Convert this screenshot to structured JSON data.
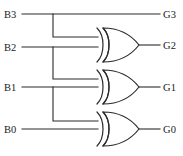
{
  "diagram": {
    "type": "logic-circuit",
    "width": 183,
    "height": 156,
    "background_color": "#ffffff",
    "line_color": "#2b2b2b",
    "text_color": "#1a1a1a"
  },
  "inputs": [
    {
      "id": "B3",
      "label": "B3",
      "label_x": 4,
      "label_y": 18,
      "wire_y": 14
    },
    {
      "id": "B2",
      "label": "B2",
      "label_x": 4,
      "label_y": 51,
      "wire_y": 47
    },
    {
      "id": "B1",
      "label": "B1",
      "label_x": 4,
      "label_y": 91,
      "wire_y": 87
    },
    {
      "id": "B0",
      "label": "B0",
      "label_x": 4,
      "label_y": 133,
      "wire_y": 129
    }
  ],
  "outputs": [
    {
      "id": "G3",
      "label": "G3",
      "label_x": 163,
      "label_y": 18,
      "wire_y": 14
    },
    {
      "id": "G2",
      "label": "G2",
      "label_x": 163,
      "label_y": 51,
      "wire_y": 45
    },
    {
      "id": "G1",
      "label": "G1",
      "label_x": 163,
      "label_y": 91,
      "wire_y": 87
    },
    {
      "id": "G0",
      "label": "G0",
      "label_x": 163,
      "label_y": 133,
      "wire_y": 129
    }
  ],
  "gates": [
    {
      "id": "xor-g2",
      "type": "XOR",
      "output": "G2",
      "inputs": [
        "B3",
        "B2"
      ],
      "x": 98,
      "y": 28,
      "width": 40,
      "height": 34
    },
    {
      "id": "xor-g1",
      "type": "XOR",
      "output": "G1",
      "inputs": [
        "B2",
        "B1"
      ],
      "x": 98,
      "y": 70,
      "width": 40,
      "height": 34
    },
    {
      "id": "xor-g0",
      "type": "XOR",
      "output": "G0",
      "inputs": [
        "B1",
        "B0"
      ],
      "x": 98,
      "y": 112,
      "width": 40,
      "height": 34
    }
  ],
  "nets": {
    "tap_x": 53,
    "gate_input_x": 98,
    "gate_output_x": 140,
    "input_wire_start_x": 22,
    "output_wire_end_x": 160
  },
  "equations": [
    "G3 = B3",
    "G2 = B3 XOR B2",
    "G1 = B2 XOR B1",
    "G0 = B1 XOR B0"
  ]
}
